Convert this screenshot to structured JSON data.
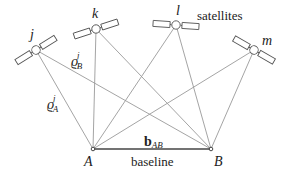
{
  "diagram": {
    "title_label": "satellites",
    "colors": {
      "line": "#9a9a9a",
      "outline": "#555555",
      "text": "#222222",
      "background": "#ffffff"
    },
    "satellites": [
      {
        "id": "j",
        "label": "j",
        "x": 36,
        "y": 50,
        "angle": -32
      },
      {
        "id": "k",
        "label": "k",
        "x": 96,
        "y": 29,
        "angle": -18
      },
      {
        "id": "l",
        "label": "l",
        "x": 176,
        "y": 25,
        "angle": 4
      },
      {
        "id": "m",
        "label": "m",
        "x": 254,
        "y": 50,
        "angle": 30
      }
    ],
    "receivers": [
      {
        "id": "A",
        "label": "A",
        "x": 93,
        "y": 149
      },
      {
        "id": "B",
        "label": "B",
        "x": 211,
        "y": 149
      }
    ],
    "ranges": [
      {
        "from": "j",
        "to": "A",
        "label": "ϱ",
        "sup": "j",
        "sub": "A"
      },
      {
        "from": "j",
        "to": "B",
        "label": "ϱ",
        "sup": "j",
        "sub": "B"
      }
    ],
    "baseline": {
      "vector_label": "b",
      "vector_sub": "AB",
      "text": "baseline"
    }
  }
}
